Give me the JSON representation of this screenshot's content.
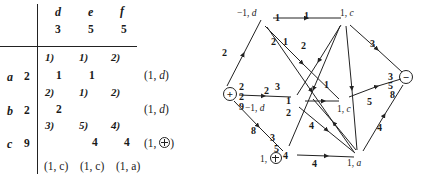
{
  "figure": {
    "kind": "transportation-tableau-and-network-diagram"
  },
  "tableau": {
    "column_headers": [
      "d",
      "e",
      "f"
    ],
    "column_values": [
      "3",
      "5",
      "5"
    ],
    "row_labels": [
      "a",
      "b",
      "c"
    ],
    "row_values": [
      "2",
      "2",
      "9"
    ],
    "rows": [
      {
        "label": "a",
        "value": "2",
        "indices": [
          "1)",
          "1)",
          "2)"
        ],
        "cells": [
          "1",
          "1",
          ""
        ],
        "tag_prefix": "(1, ",
        "tag_suffix": ")",
        "tag_symbol": "d",
        "tag_symbol_is_circle": false
      },
      {
        "label": "b",
        "value": "2",
        "indices": [
          "2)",
          "1)",
          "2)"
        ],
        "cells": [
          "2",
          "",
          ""
        ],
        "tag_prefix": "(1, ",
        "tag_suffix": ")",
        "tag_symbol": "d",
        "tag_symbol_is_circle": false
      },
      {
        "label": "c",
        "value": "9",
        "indices": [
          "3)",
          "5)",
          "4)"
        ],
        "cells": [
          "",
          "4",
          "4"
        ],
        "tag_prefix": "(1, ",
        "tag_suffix": ")",
        "tag_symbol": "",
        "tag_symbol_is_circle": true
      }
    ],
    "footer": [
      "(1, c)",
      "(1, c)",
      "(1, a)"
    ]
  },
  "graph": {
    "source_symbol": "+",
    "sink_symbol": "−",
    "nodes": [
      {
        "id": "n-top-left",
        "label_pre": "−1, ",
        "label_it": "d",
        "label_post": ""
      },
      {
        "id": "n-top-right",
        "label_pre": "1, ",
        "label_it": "c",
        "label_post": ""
      },
      {
        "id": "n-mid-left",
        "label_pre": "−1, ",
        "label_it": "d",
        "label_post": ""
      },
      {
        "id": "n-mid-right",
        "label_pre": "1, ",
        "label_it": "c",
        "label_post": ""
      },
      {
        "id": "n-bottom-left",
        "label_pre": "1, ",
        "label_it": "",
        "label_post": ""
      },
      {
        "id": "n-bottom-right",
        "label_pre": "1, ",
        "label_it": "a",
        "label_post": ""
      }
    ],
    "source_out_labels": [
      "2",
      "2",
      "9"
    ],
    "edge_labels": {
      "src_to_topleft": "2",
      "src_to_midleft": "2",
      "src_to_botleft": "8",
      "topleft_to_topright": "1",
      "topleft_down_a": "2",
      "topleft_down_b": "1",
      "topright_to_sink": "3",
      "cross_2": "2",
      "cross_1": "1",
      "cross_3": "3",
      "midleft_1": "1",
      "midleft_2": "2",
      "mid_4": "4",
      "midright_to_sink_5": "5",
      "midright_5": "5",
      "sink_in_3": "3",
      "sink_in_5": "5",
      "sink_in_8": "8",
      "botleft_3": "3",
      "botleft_5": "5",
      "botleft_4": "4",
      "bot_4": "4",
      "botright_to_sink_4": "4"
    }
  },
  "colors": {
    "ink": "#1a1a1a",
    "rule": "#222222",
    "background": "#ffffff"
  }
}
